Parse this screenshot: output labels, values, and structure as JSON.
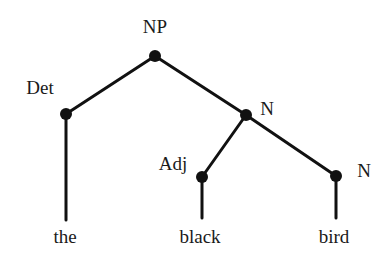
{
  "diagram": {
    "type": "syntax-tree",
    "colors": {
      "ink": "#111111",
      "background": "#ffffff"
    },
    "nodes": [
      {
        "id": "np",
        "label": "NP",
        "x": 155,
        "y": 56,
        "label_x": 155,
        "label_y": 33,
        "anchor": "middle"
      },
      {
        "id": "det",
        "label": "Det",
        "x": 66,
        "y": 114,
        "label_x": 40,
        "label_y": 94,
        "anchor": "middle"
      },
      {
        "id": "n1",
        "label": "N",
        "x": 246,
        "y": 115,
        "label_x": 267,
        "label_y": 115,
        "anchor": "middle"
      },
      {
        "id": "adj",
        "label": "Adj",
        "x": 202,
        "y": 177,
        "label_x": 173,
        "label_y": 170,
        "anchor": "middle"
      },
      {
        "id": "n2",
        "label": "N",
        "x": 336,
        "y": 176,
        "label_x": 364,
        "label_y": 177,
        "anchor": "middle"
      }
    ],
    "edges": [
      {
        "from": "np",
        "to": "det"
      },
      {
        "from": "np",
        "to": "n1"
      },
      {
        "from": "n1",
        "to": "adj"
      },
      {
        "from": "n1",
        "to": "n2"
      }
    ],
    "leaves": [
      {
        "parent": "det",
        "word": "the",
        "line_end_y": 220,
        "text_x": 65,
        "text_y": 243
      },
      {
        "parent": "adj",
        "word": "black",
        "line_end_y": 218,
        "text_x": 200,
        "text_y": 243
      },
      {
        "parent": "n2",
        "word": "bird",
        "line_end_y": 218,
        "text_x": 334,
        "text_y": 243
      }
    ]
  }
}
